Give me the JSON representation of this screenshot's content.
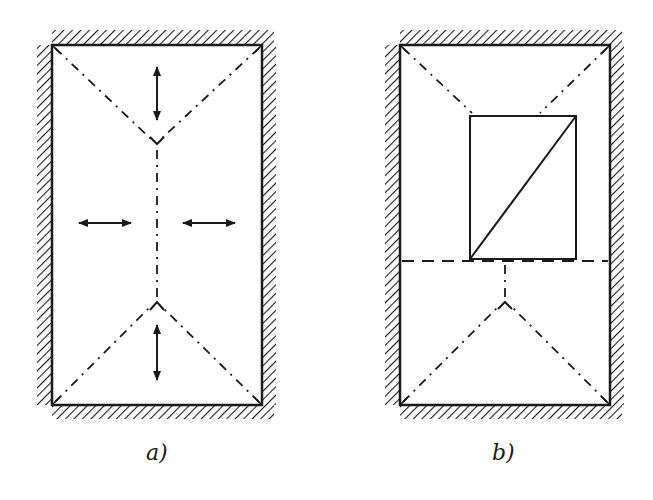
{
  "figure": {
    "panels": [
      {
        "id": "a",
        "label": "a)",
        "description": "Rectangular room with hatched walls; dash-dot yield lines from corners meeting at a central ridge; arrows indicate expansion directions"
      },
      {
        "id": "b",
        "label": "b)",
        "description": "Same hatched room containing an inner rectangle with a diagonal; horizontal dashed line at the inner rectangle's base; dash-dot yield lines"
      }
    ],
    "colors": {
      "stroke": "#1a1a1a",
      "background": "#ffffff"
    }
  }
}
